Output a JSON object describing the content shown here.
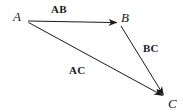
{
  "figure": {
    "background_color": "#ffffff",
    "stroke_color": "#1a1a1a",
    "vertices": [
      {
        "id": "A",
        "label": "A",
        "x": 28,
        "y": 21
      },
      {
        "id": "B",
        "label": "B",
        "x": 118,
        "y": 23
      },
      {
        "id": "C",
        "label": "C",
        "x": 164,
        "y": 96
      }
    ],
    "vectors": [
      {
        "id": "AB",
        "label": "AB",
        "from": "A",
        "to": "B"
      },
      {
        "id": "BC",
        "label": "BC",
        "from": "B",
        "to": "C"
      },
      {
        "id": "AC",
        "label": "AC",
        "from": "A",
        "to": "C"
      }
    ]
  }
}
